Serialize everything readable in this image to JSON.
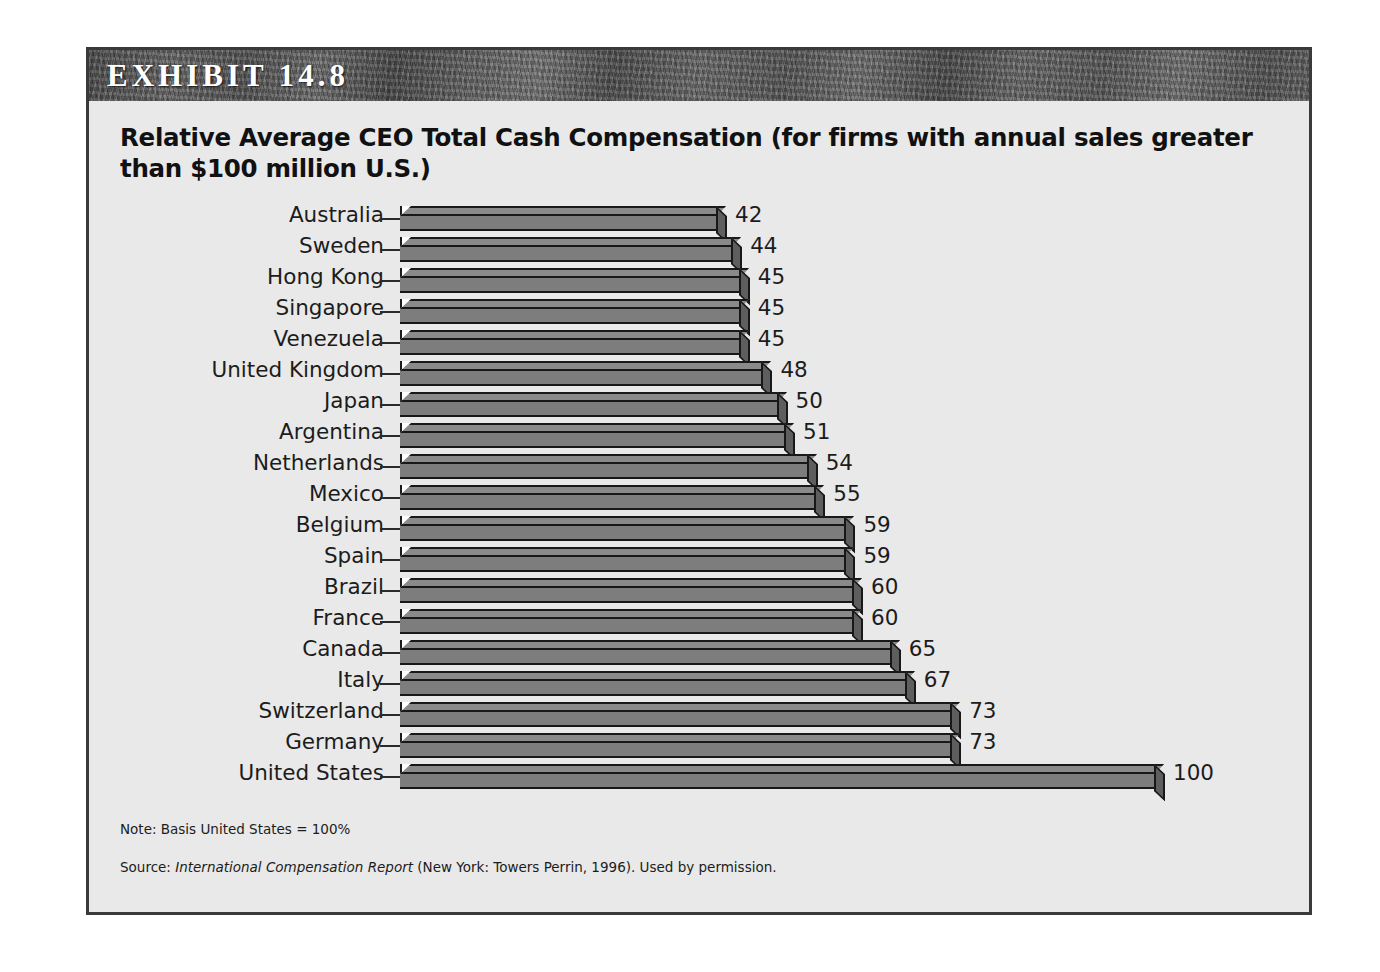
{
  "exhibit": {
    "label": "EXHIBIT 14.8",
    "title": "Relative Average CEO Total Cash Compensation (for firms with annual sales greater than $100 million U.S.)",
    "note": "Note: Basis United States = 100%",
    "source_prefix": "Source: ",
    "source_italic": "International Compensation Report",
    "source_suffix": " (New York: Towers Perrin, 1996). Used by permission.",
    "colors": {
      "band": "#585858",
      "panel": "#e9e9e9",
      "bar_face": "#7d7d7d",
      "bar_top": "#8a8a8a",
      "bar_cap": "#5e5e5e",
      "outline": "#181818",
      "border": "#3a3a3a",
      "text": "#1c1c1c"
    }
  },
  "chart_data": {
    "type": "bar",
    "orientation": "horizontal",
    "title": "Relative Average CEO Total Cash Compensation (for firms with annual sales greater than $100 million U.S.)",
    "xlabel": "",
    "ylabel": "",
    "xlim": [
      0,
      100
    ],
    "grid": false,
    "legend": "none",
    "value_labels": true,
    "categories": [
      "Australia",
      "Sweden",
      "Hong Kong",
      "Singapore",
      "Venezuela",
      "United Kingdom",
      "Japan",
      "Argentina",
      "Netherlands",
      "Mexico",
      "Belgium",
      "Spain",
      "Brazil",
      "France",
      "Canada",
      "Italy",
      "Switzerland",
      "Germany",
      "United States"
    ],
    "values": [
      42,
      44,
      45,
      45,
      45,
      48,
      50,
      51,
      54,
      55,
      59,
      59,
      60,
      60,
      65,
      67,
      73,
      73,
      100
    ],
    "labels": [
      "42",
      "44",
      "45",
      "45",
      "45",
      "48",
      "50",
      "51",
      "54",
      "55",
      "59",
      "59",
      "60",
      "60",
      "65",
      "67",
      "73",
      "73",
      "100"
    ],
    "note": "Note: Basis United States = 100%"
  }
}
